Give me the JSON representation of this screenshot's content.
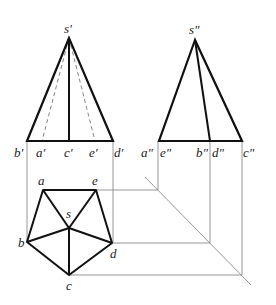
{
  "diagram": {
    "colors": {
      "thick": "#111111",
      "thin": "#888888",
      "dashed": "#777777",
      "label": "#222222"
    },
    "front_view": {
      "apex": {
        "label": "s'",
        "x": 69,
        "y": 38
      },
      "base_y": 141,
      "base_points": [
        {
          "label": "b'",
          "x": 27
        },
        {
          "label": "a'",
          "x": 42
        },
        {
          "label": "c'",
          "x": 69
        },
        {
          "label": "e'",
          "x": 95
        },
        {
          "label": "d'",
          "x": 113
        }
      ]
    },
    "side_view": {
      "apex": {
        "label": "s\"",
        "x": 195,
        "y": 40
      },
      "base_y": 141,
      "base_points": [
        {
          "label": "a\"",
          "x": 159
        },
        {
          "label": "e\"",
          "x": 159
        },
        {
          "label": "b\"",
          "x": 210
        },
        {
          "label": "d\"",
          "x": 212
        },
        {
          "label": "c\"",
          "x": 242
        }
      ]
    },
    "top_view": {
      "points": [
        {
          "label": "a",
          "x": 43,
          "y": 190
        },
        {
          "label": "e",
          "x": 96,
          "y": 190
        },
        {
          "label": "s",
          "x": 69,
          "y": 228
        },
        {
          "label": "b",
          "x": 27,
          "y": 242
        },
        {
          "label": "d",
          "x": 112,
          "y": 243
        },
        {
          "label": "c",
          "x": 69,
          "y": 275
        }
      ]
    },
    "labels": {
      "s_front": "s'",
      "s_side": "s\"",
      "b_front": "b'",
      "a_front": "a'",
      "c_front": "c'",
      "e_front": "e'",
      "d_front": "d'",
      "a_side": "a\"",
      "e_side": "e\"",
      "b_side": "b\"",
      "d_side": "d\"",
      "c_side": "c\"",
      "a_top": "a",
      "e_top": "e",
      "s_top": "s",
      "b_top": "b",
      "d_top": "d",
      "c_top": "c"
    }
  }
}
